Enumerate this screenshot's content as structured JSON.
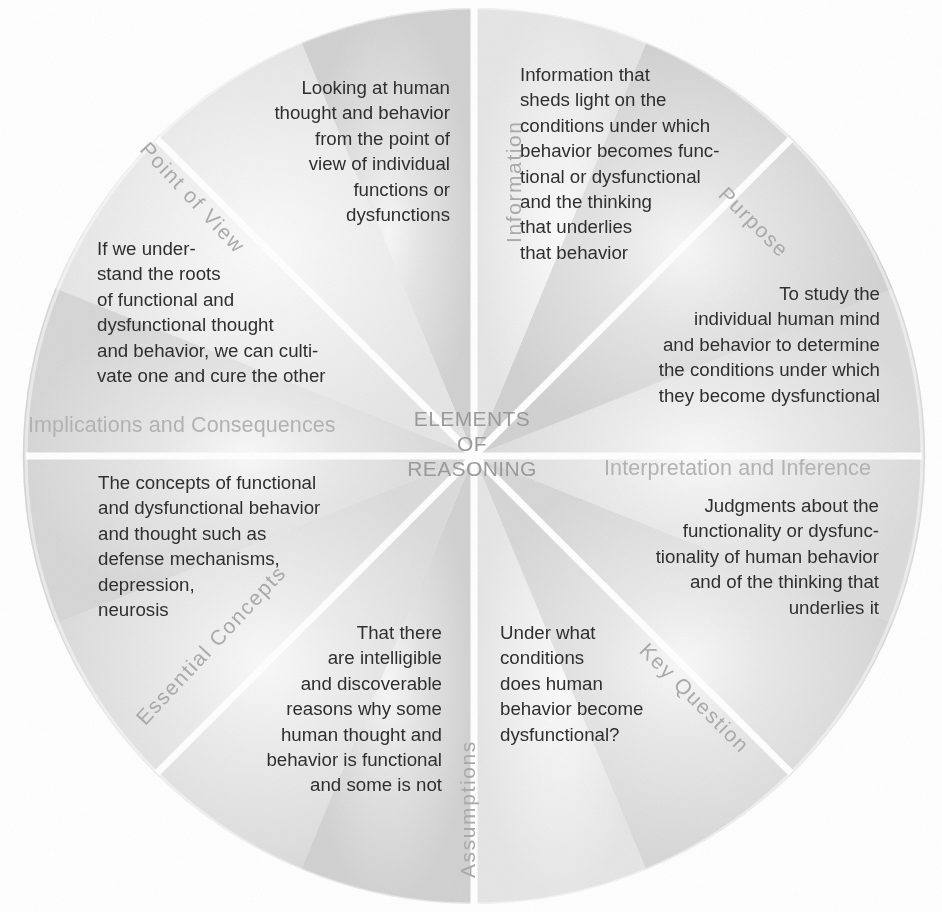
{
  "diagram": {
    "title_center": [
      "ELEMENTS",
      "OF",
      "REASONING"
    ],
    "shape": "circle-divided-into-eight-sectors",
    "colors": {
      "background": "#ffffff",
      "sector_fill_light": "#f2f2f2",
      "sector_fill_mid": "#e3e3e3",
      "sector_fill_dark": "#d6d6d6",
      "divider": "#ffffff",
      "body_text": "#2f2f2f",
      "category_label": "#b2b2b2",
      "spoke_label": "#a9a9a9",
      "center_text": "#9a9a9a"
    },
    "sectors": [
      {
        "id": "point-of-view",
        "label": "Point of View",
        "label_style": "rotated-spoke",
        "text": "Looking at human\nthought and behavior\nfrom the point of\nview of individual\nfunctions or\ndysfunctions",
        "align": "right"
      },
      {
        "id": "information",
        "label": "Information",
        "label_style": "rotated-spoke",
        "text": "Information that\nsheds light on the\nconditions under which\nbehavior becomes func-\ntional or dysfunctional\nand the thinking\nthat underlies\nthat behavior",
        "align": "left"
      },
      {
        "id": "purpose",
        "label": "Purpose",
        "label_style": "rotated-spoke",
        "text": "To study the\nindividual human mind\nand behavior to determine\nthe conditions under which\nthey become dysfunctional",
        "align": "right"
      },
      {
        "id": "interpretation-and-inference",
        "label": "Interpretation and Inference",
        "label_style": "horizontal",
        "text": "Judgments about the\nfunctionality or dysfunc-\ntionality of human behavior\nand of the thinking that\nunderlies it",
        "align": "right"
      },
      {
        "id": "key-question",
        "label": "Key Question",
        "label_style": "rotated-spoke",
        "text": "Under what\nconditions\ndoes human\nbehavior become\ndysfunctional?",
        "align": "left"
      },
      {
        "id": "assumptions",
        "label": "Assumptions",
        "label_style": "rotated-spoke",
        "text": "That there\nare intelligible\nand discoverable\nreasons why some\nhuman thought and\nbehavior is functional\nand some is not",
        "align": "right"
      },
      {
        "id": "essential-concepts",
        "label": "Essential Concepts",
        "label_style": "rotated-spoke",
        "text": "The concepts of functional\nand dysfunctional behavior\nand thought such as\ndefense mechanisms,\ndepression,\nneurosis",
        "align": "left"
      },
      {
        "id": "implications-and-consequences",
        "label": "Implications and Consequences",
        "label_style": "horizontal",
        "text": "If we under-\nstand the roots\nof functional and\ndysfunctional thought\nand behavior, we can culti-\nvate one and cure the other",
        "align": "left"
      }
    ]
  }
}
